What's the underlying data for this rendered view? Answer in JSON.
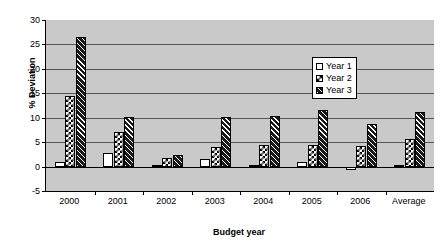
{
  "chart_data": {
    "type": "bar",
    "title": "",
    "xlabel": "Budget year",
    "ylabel": "% Deviation",
    "categories": [
      "2000",
      "2001",
      "2002",
      "2003",
      "2004",
      "2005",
      "2006",
      "Average"
    ],
    "series": [
      {
        "name": "Year 1",
        "values": [
          1.0,
          2.8,
          0.2,
          1.6,
          0.0,
          0.9,
          -0.7,
          0.4
        ]
      },
      {
        "name": "Year 2",
        "values": [
          14.5,
          7.0,
          1.7,
          4.1,
          4.5,
          4.5,
          4.2,
          5.7
        ]
      },
      {
        "name": "Year 3",
        "values": [
          26.5,
          10.2,
          2.3,
          10.1,
          10.3,
          11.6,
          8.7,
          11.2
        ]
      }
    ],
    "ylim": [
      -5,
      30
    ],
    "yticks": [
      -5,
      0,
      5,
      10,
      15,
      20,
      25,
      30
    ],
    "ytick_labels": [
      "-5",
      "0",
      "5",
      "10",
      "15",
      "20",
      "25",
      "30"
    ],
    "grid": true,
    "legend_position": "upper right",
    "plot_background": "#c9c9c9",
    "axis_color": "#000000",
    "gridline_color": "#555555"
  },
  "legend": {
    "entries": [
      {
        "label": "Year 1",
        "swatch": "dotted-white"
      },
      {
        "label": "Year 2",
        "swatch": "checkerboard"
      },
      {
        "label": "Year 3",
        "swatch": "diagonal-hatch"
      }
    ]
  }
}
